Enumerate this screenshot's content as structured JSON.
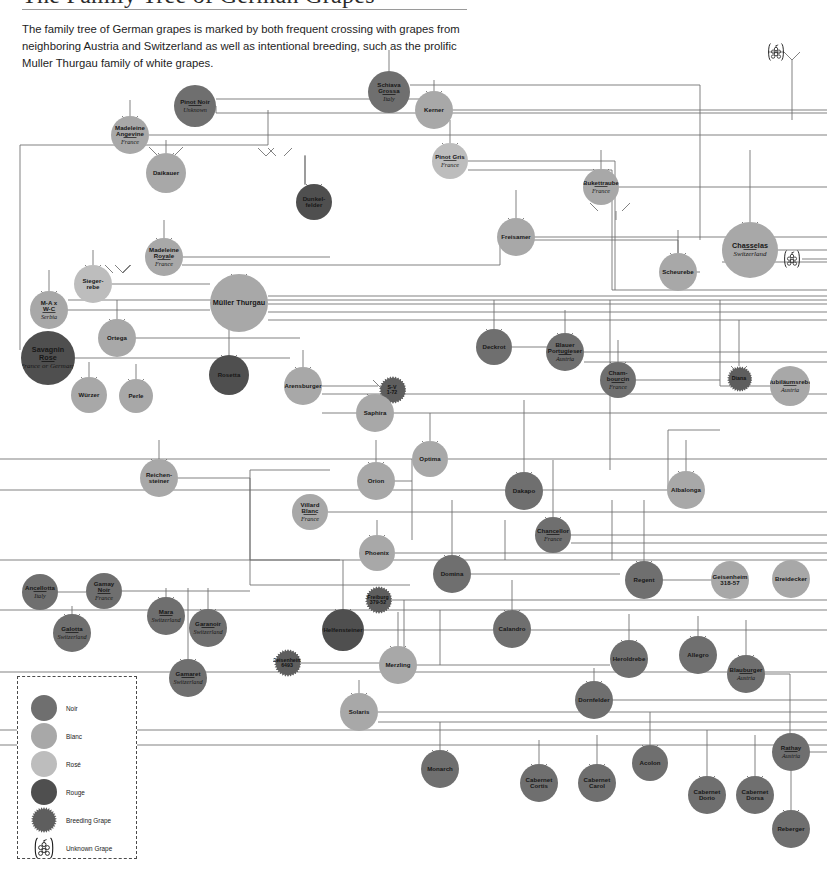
{
  "header": {
    "title": "The Family Tree of German Grapes",
    "intro": "The family tree of German grapes is marked by both frequent crossing with grapes from neighboring Austria and Switzerland as well as intentional breeding, such as the prolific Muller Thurgau family of white grapes."
  },
  "legend": {
    "items": [
      {
        "label": "Noir",
        "kind": "noir",
        "color": "#6f6f6f"
      },
      {
        "label": "Blanc",
        "kind": "blanc",
        "color": "#a8a8a8"
      },
      {
        "label": "Rosé",
        "kind": "rose",
        "color": "#bdbdbd"
      },
      {
        "label": "Rouge",
        "kind": "rouge",
        "color": "#4f4f4f"
      },
      {
        "label": "Breeding Grape",
        "kind": "breed",
        "color": "#5e5e5e"
      },
      {
        "label": "Unknown Grape",
        "kind": "unknown",
        "color": "#1a1a1a"
      }
    ]
  },
  "colors": {
    "noir": "#6f6f6f",
    "blanc": "#a8a8a8",
    "rose": "#bdbdbd",
    "rouge": "#4f4f4f",
    "breeding": "#5e5e5e",
    "wire": "#6b6b6b",
    "text": "#171717"
  },
  "chart_data": {
    "type": "diagram",
    "title": "The Family Tree of German Grapes",
    "subtype": "genealogy-network",
    "node_categories": [
      "Noir",
      "Blanc",
      "Rosé",
      "Rouge",
      "Breeding Grape",
      "Unknown Grape"
    ],
    "nodes": [
      {
        "id": "pinot-noir",
        "name": "Pinot Noir",
        "origin": "Unknown",
        "kind": "noir",
        "x": 195,
        "y": 106,
        "r": 21
      },
      {
        "id": "schiava-grossa",
        "name": "Schiava\nGrossa",
        "origin": "Italy",
        "kind": "noir",
        "x": 389,
        "y": 92,
        "r": 21
      },
      {
        "id": "kerner",
        "name": "Kerner",
        "origin": "",
        "kind": "blanc",
        "x": 434,
        "y": 110,
        "r": 19
      },
      {
        "id": "madeleine-angevine",
        "name": "Madeleine\nAngevine",
        "origin": "France",
        "kind": "blanc",
        "x": 130,
        "y": 135,
        "r": 19
      },
      {
        "id": "daikauer",
        "name": "Daikauer",
        "origin": "",
        "kind": "blanc",
        "x": 166,
        "y": 173,
        "r": 20
      },
      {
        "id": "pinot-gris",
        "name": "Pinot Gris",
        "origin": "France",
        "kind": "rose",
        "x": 450,
        "y": 161,
        "r": 18
      },
      {
        "id": "bukettraube",
        "name": "Bukettraube",
        "origin": "France",
        "kind": "blanc",
        "x": 601,
        "y": 187,
        "r": 18
      },
      {
        "id": "dunkelfelder",
        "name": "Dunkel-\nfelder",
        "origin": "",
        "kind": "rouge",
        "x": 314,
        "y": 202,
        "r": 18
      },
      {
        "id": "freisamer",
        "name": "Freisamer",
        "origin": "",
        "kind": "blanc",
        "x": 516,
        "y": 237,
        "r": 19
      },
      {
        "id": "madeleine-royale",
        "name": "Madeleine\nRoyale",
        "origin": "France",
        "kind": "blanc",
        "x": 164,
        "y": 257,
        "r": 19
      },
      {
        "id": "chasselas",
        "name": "Chasselas",
        "origin": "Switzerland",
        "kind": "blanc",
        "x": 750,
        "y": 250,
        "r": 28
      },
      {
        "id": "scheurebe",
        "name": "Scheurebe",
        "origin": "",
        "kind": "blanc",
        "x": 678,
        "y": 272,
        "r": 19
      },
      {
        "id": "siegerrebe",
        "name": "Sieger-\nrebe",
        "origin": "",
        "kind": "rose",
        "x": 93,
        "y": 284,
        "r": 19
      },
      {
        "id": "mueller-thurgau",
        "name": "Müller Thurgau",
        "origin": "",
        "kind": "blanc",
        "x": 239,
        "y": 303,
        "r": 29
      },
      {
        "id": "ma-wc",
        "name": "M-A x\nW-C",
        "origin": "Serbia",
        "kind": "blanc",
        "x": 49,
        "y": 310,
        "r": 19
      },
      {
        "id": "ortega",
        "name": "Ortega",
        "origin": "",
        "kind": "blanc",
        "x": 117,
        "y": 338,
        "r": 19
      },
      {
        "id": "deckrot",
        "name": "Deckrot",
        "origin": "",
        "kind": "noir",
        "x": 494,
        "y": 347,
        "r": 18
      },
      {
        "id": "blauer-portugieser",
        "name": "Blauer\nPortugieser",
        "origin": "Austria",
        "kind": "noir",
        "x": 565,
        "y": 352,
        "r": 19
      },
      {
        "id": "savagnin-rose",
        "name": "Savagnin\nRose",
        "origin": "France or\nGermany",
        "kind": "rouge",
        "x": 48,
        "y": 358,
        "r": 27
      },
      {
        "id": "rosetta",
        "name": "Rosetta",
        "origin": "",
        "kind": "rouge",
        "x": 229,
        "y": 375,
        "r": 20
      },
      {
        "id": "diana",
        "name": "Diana",
        "origin": "",
        "kind": "breed",
        "x": 739,
        "y": 379,
        "r": 13
      },
      {
        "id": "chambourcin",
        "name": "Cham-\nbourcin",
        "origin": "France",
        "kind": "noir",
        "x": 618,
        "y": 380,
        "r": 18
      },
      {
        "id": "arensburger",
        "name": "Arensburger",
        "origin": "",
        "kind": "blanc",
        "x": 303,
        "y": 386,
        "r": 19
      },
      {
        "id": "sv-1-72",
        "name": "S-V\n1-72",
        "origin": "",
        "kind": "breed",
        "x": 392,
        "y": 390,
        "r": 14
      },
      {
        "id": "jubilaeumsrebe",
        "name": "Jubiläumsrebe",
        "origin": "Austria",
        "kind": "blanc",
        "x": 790,
        "y": 386,
        "r": 20
      },
      {
        "id": "wuerzer",
        "name": "Würzer",
        "origin": "",
        "kind": "blanc",
        "x": 89,
        "y": 395,
        "r": 18
      },
      {
        "id": "perle",
        "name": "Perle",
        "origin": "",
        "kind": "blanc",
        "x": 136,
        "y": 396,
        "r": 17
      },
      {
        "id": "saphira",
        "name": "Saphira",
        "origin": "",
        "kind": "blanc",
        "x": 375,
        "y": 413,
        "r": 19
      },
      {
        "id": "optima",
        "name": "Optima",
        "origin": "",
        "kind": "blanc",
        "x": 430,
        "y": 459,
        "r": 18
      },
      {
        "id": "reichensteiner",
        "name": "Reichen-\nsteiner",
        "origin": "",
        "kind": "blanc",
        "x": 159,
        "y": 478,
        "r": 19
      },
      {
        "id": "orion",
        "name": "Orion",
        "origin": "",
        "kind": "blanc",
        "x": 376,
        "y": 481,
        "r": 19
      },
      {
        "id": "albalonga",
        "name": "Albalonga",
        "origin": "",
        "kind": "blanc",
        "x": 686,
        "y": 490,
        "r": 19
      },
      {
        "id": "dakapo",
        "name": "Dakapo",
        "origin": "",
        "kind": "noir",
        "x": 524,
        "y": 491,
        "r": 19
      },
      {
        "id": "villard-blanc",
        "name": "Villard\nBlanc",
        "origin": "France",
        "kind": "blanc",
        "x": 310,
        "y": 512,
        "r": 18
      },
      {
        "id": "chancellor",
        "name": "Chancellor",
        "origin": "France",
        "kind": "noir",
        "x": 553,
        "y": 535,
        "r": 18
      },
      {
        "id": "phoenix",
        "name": "Phoenix",
        "origin": "",
        "kind": "blanc",
        "x": 377,
        "y": 553,
        "r": 18
      },
      {
        "id": "domina",
        "name": "Domina",
        "origin": "",
        "kind": "noir",
        "x": 452,
        "y": 574,
        "r": 19
      },
      {
        "id": "regent",
        "name": "Regent",
        "origin": "",
        "kind": "noir",
        "x": 644,
        "y": 580,
        "r": 19
      },
      {
        "id": "geisenheim-318-57",
        "name": "Geisenheim\n318-57",
        "origin": "",
        "kind": "blanc",
        "x": 730,
        "y": 580,
        "r": 19
      },
      {
        "id": "breidecker",
        "name": "Breidecker",
        "origin": "",
        "kind": "blanc",
        "x": 791,
        "y": 579,
        "r": 19
      },
      {
        "id": "ancellotta",
        "name": "Ancellotta",
        "origin": "Italy",
        "kind": "noir",
        "x": 40,
        "y": 592,
        "r": 18
      },
      {
        "id": "gamay-noir",
        "name": "Gamay Noir",
        "origin": "France",
        "kind": "noir",
        "x": 104,
        "y": 591,
        "r": 18
      },
      {
        "id": "freiburg-379-52",
        "name": "Freiburg\n379-52",
        "origin": "",
        "kind": "breed",
        "x": 378,
        "y": 600,
        "r": 14
      },
      {
        "id": "calandro",
        "name": "Calandro",
        "origin": "",
        "kind": "noir",
        "x": 512,
        "y": 629,
        "r": 19
      },
      {
        "id": "mara",
        "name": "Mara",
        "origin": "Switzerland",
        "kind": "noir",
        "x": 166,
        "y": 616,
        "r": 19
      },
      {
        "id": "garanoir",
        "name": "Garanoir",
        "origin": "Switzerland",
        "kind": "noir",
        "x": 208,
        "y": 628,
        "r": 19
      },
      {
        "id": "galotta",
        "name": "Galotta",
        "origin": "Switzerland",
        "kind": "noir",
        "x": 72,
        "y": 633,
        "r": 19
      },
      {
        "id": "helfensteiner",
        "name": "Helfensteiner",
        "origin": "",
        "kind": "rouge",
        "x": 343,
        "y": 630,
        "r": 21
      },
      {
        "id": "allegro",
        "name": "Allegro",
        "origin": "",
        "kind": "noir",
        "x": 698,
        "y": 655,
        "r": 19
      },
      {
        "id": "geisenheim-6493",
        "name": "Geisenheim\n6493",
        "origin": "",
        "kind": "breed",
        "x": 287,
        "y": 663,
        "r": 14
      },
      {
        "id": "merzling",
        "name": "Merzling",
        "origin": "",
        "kind": "blanc",
        "x": 398,
        "y": 665,
        "r": 19
      },
      {
        "id": "heroldrebe",
        "name": "Heroldrebe",
        "origin": "",
        "kind": "noir",
        "x": 629,
        "y": 659,
        "r": 19
      },
      {
        "id": "gamaret",
        "name": "Gamaret",
        "origin": "Switzerland",
        "kind": "noir",
        "x": 188,
        "y": 678,
        "r": 19
      },
      {
        "id": "blauburger",
        "name": "Blauburger",
        "origin": "Austria",
        "kind": "noir",
        "x": 746,
        "y": 674,
        "r": 19
      },
      {
        "id": "dornfelder",
        "name": "Dornfelder",
        "origin": "",
        "kind": "noir",
        "x": 594,
        "y": 700,
        "r": 19
      },
      {
        "id": "solaris",
        "name": "Solaris",
        "origin": "",
        "kind": "blanc",
        "x": 359,
        "y": 712,
        "r": 19
      },
      {
        "id": "rathay",
        "name": "Rathay",
        "origin": "Austria",
        "kind": "noir",
        "x": 791,
        "y": 752,
        "r": 19
      },
      {
        "id": "acolon",
        "name": "Acolon",
        "origin": "",
        "kind": "noir",
        "x": 650,
        "y": 763,
        "r": 18
      },
      {
        "id": "monarch",
        "name": "Monarch",
        "origin": "",
        "kind": "noir",
        "x": 440,
        "y": 769,
        "r": 19
      },
      {
        "id": "cabernet-cortis",
        "name": "Cabernet\nCortis",
        "origin": "",
        "kind": "noir",
        "x": 539,
        "y": 783,
        "r": 19
      },
      {
        "id": "cabernet-carol",
        "name": "Cabernet\nCarol",
        "origin": "",
        "kind": "noir",
        "x": 597,
        "y": 783,
        "r": 19
      },
      {
        "id": "cabernet-dorio",
        "name": "Cabernet\nDorio",
        "origin": "",
        "kind": "noir",
        "x": 707,
        "y": 795,
        "r": 19
      },
      {
        "id": "cabernet-dorsa",
        "name": "Cabernet\nDorsa",
        "origin": "",
        "kind": "noir",
        "x": 755,
        "y": 795,
        "r": 19
      },
      {
        "id": "reberger",
        "name": "Reberger",
        "origin": "",
        "kind": "noir",
        "x": 791,
        "y": 829,
        "r": 19
      }
    ],
    "unknown_markers": [
      {
        "id": "unknown-top",
        "x": 776,
        "y": 52
      },
      {
        "id": "unknown-mid",
        "x": 792,
        "y": 259
      }
    ]
  }
}
